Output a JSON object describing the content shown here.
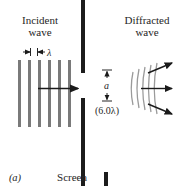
{
  "figure": {
    "panel_label": "(a)",
    "screen_label": "Screen"
  },
  "incident": {
    "title_line1": "Incident",
    "title_line2": "wave",
    "wavelength_symbol": "λ",
    "wavefront_count": 6,
    "direction": "left-to-right"
  },
  "slit": {
    "width_symbol": "a",
    "width_value": "(6.0λ)"
  },
  "diffracted": {
    "title_line1": "Diffracted",
    "title_line2": "wave",
    "wavefront_count": 5,
    "ray_count": 3
  },
  "colors": {
    "barrier": "#1c1c1c",
    "wavefront": "#7a7a7a",
    "diffracted_wavefront": "#9a9a9a",
    "arrow": "#1a1a1a",
    "text": "#262626",
    "background": "#ffffff"
  }
}
